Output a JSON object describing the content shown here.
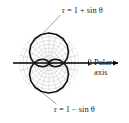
{
  "figure": {
    "kind": "polar-plot",
    "caption_fragment": "",
    "labels": {
      "top_curve": "r = 1 + sin θ",
      "bottom_curve": "r = 1 − sin θ",
      "axis_name_line1": "Polar",
      "axis_name_line2": "axis",
      "tick_label": "2"
    },
    "colors": {
      "curve": "#111111",
      "axis": "#000000",
      "grid": "#b9bcc4",
      "background": "#ffffff",
      "text": "#1a1a1a"
    }
  },
  "chart_data": {
    "type": "line",
    "subtype": "polar",
    "title": "",
    "xlabel": "Polar axis",
    "ylabel": "",
    "grid": true,
    "legend_position": "annotated-callouts",
    "polar": {
      "r_ticks": [
        0.5,
        1,
        1.5,
        2
      ],
      "r_tick_labels_shown": [
        "2"
      ],
      "rlim": [
        0,
        2
      ],
      "theta_gridlines_deg": [
        0,
        15,
        30,
        45,
        60,
        75,
        90,
        105,
        120,
        135,
        150,
        165,
        180,
        195,
        210,
        225,
        240,
        255,
        270,
        285,
        300,
        315,
        330,
        345
      ],
      "axis_arrow": true,
      "axis_direction_deg": 0
    },
    "series": [
      {
        "name": "r = 1 + sin θ",
        "equation": "r = 1 + sin(theta)",
        "shape": "cardioid",
        "orientation": "up",
        "max_r": 2,
        "max_r_at_theta_deg": 90,
        "cusp_at_theta_deg": 270,
        "label_anchor_deg": 70,
        "theta_deg": [
          0,
          15,
          30,
          45,
          60,
          75,
          90,
          105,
          120,
          135,
          150,
          165,
          180,
          195,
          210,
          225,
          240,
          255,
          270,
          285,
          300,
          315,
          330,
          345,
          360
        ],
        "r": [
          1.0,
          1.259,
          1.5,
          1.707,
          1.866,
          1.966,
          2.0,
          1.966,
          1.866,
          1.707,
          1.5,
          1.259,
          1.0,
          0.741,
          0.5,
          0.293,
          0.134,
          0.034,
          0.0,
          0.034,
          0.134,
          0.293,
          0.5,
          0.741,
          1.0
        ]
      },
      {
        "name": "r = 1 − sin θ",
        "equation": "r = 1 - sin(theta)",
        "shape": "cardioid",
        "orientation": "down",
        "max_r": 2,
        "max_r_at_theta_deg": 270,
        "cusp_at_theta_deg": 90,
        "label_anchor_deg": 290,
        "theta_deg": [
          0,
          15,
          30,
          45,
          60,
          75,
          90,
          105,
          120,
          135,
          150,
          165,
          180,
          195,
          210,
          225,
          240,
          255,
          270,
          285,
          300,
          315,
          330,
          345,
          360
        ],
        "r": [
          1.0,
          0.741,
          0.5,
          0.293,
          0.134,
          0.034,
          0.0,
          0.034,
          0.134,
          0.293,
          0.5,
          0.741,
          1.0,
          1.259,
          1.5,
          1.707,
          1.866,
          1.966,
          2.0,
          1.966,
          1.866,
          1.707,
          1.5,
          1.259,
          1.0
        ]
      }
    ],
    "annotations": [
      {
        "text": "r = 1 + sin θ",
        "points_to": "upper cardioid upper-right arc"
      },
      {
        "text": "r = 1 − sin θ",
        "points_to": "lower cardioid lower-right arc"
      },
      {
        "text": "2",
        "points_to": "polar axis tick at r = 2"
      },
      {
        "text": "Polar axis",
        "points_to": "horizontal arrow to the right"
      }
    ]
  }
}
